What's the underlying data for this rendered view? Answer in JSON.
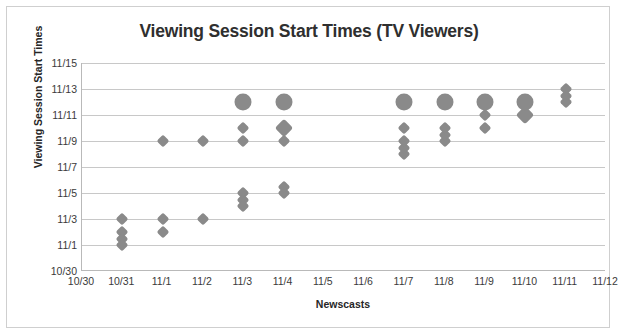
{
  "chart_data": {
    "type": "scatter",
    "title": "Viewing Session Start Times (TV Viewers)",
    "xlabel": "Newscasts",
    "ylabel": "Viewing Session Start Times",
    "grid": true,
    "legend": "none",
    "x_tick_labels": [
      "10/30",
      "10/31",
      "11/1",
      "11/2",
      "11/3",
      "11/4",
      "11/5",
      "11/6",
      "11/7",
      "11/8",
      "11/9",
      "11/10",
      "11/11",
      "11/12"
    ],
    "y_tick_labels": [
      "11/15",
      "11/13",
      "11/11",
      "11/9",
      "11/7",
      "11/5",
      "11/3",
      "11/1",
      "10/30"
    ],
    "xlim": [
      "10/30",
      "11/12"
    ],
    "ylim": [
      "10/30",
      "11/15"
    ],
    "x_values_numeric": [
      30,
      31,
      32,
      33,
      34,
      35,
      36,
      37,
      38,
      39,
      40,
      41,
      42,
      43
    ],
    "y_values_numeric": [
      46,
      44,
      42,
      40,
      38,
      36,
      34,
      32,
      30
    ],
    "points": [
      {
        "x": "10/31",
        "y": "11/3",
        "size": "small"
      },
      {
        "x": "10/31",
        "y": "11/2",
        "size": "small"
      },
      {
        "x": "10/31",
        "y": "11/1.5",
        "size": "small"
      },
      {
        "x": "10/31",
        "y": "11/1",
        "size": "small"
      },
      {
        "x": "11/1",
        "y": "11/3",
        "size": "small"
      },
      {
        "x": "11/1",
        "y": "11/2",
        "size": "small"
      },
      {
        "x": "11/1",
        "y": "11/9",
        "size": "small"
      },
      {
        "x": "11/2",
        "y": "11/3",
        "size": "small"
      },
      {
        "x": "11/2",
        "y": "11/9",
        "size": "small"
      },
      {
        "x": "11/3",
        "y": "11/5",
        "size": "small"
      },
      {
        "x": "11/3",
        "y": "11/4.5",
        "size": "small"
      },
      {
        "x": "11/3",
        "y": "11/4",
        "size": "small"
      },
      {
        "x": "11/3",
        "y": "11/9",
        "size": "small"
      },
      {
        "x": "11/3",
        "y": "11/10",
        "size": "small"
      },
      {
        "x": "11/3",
        "y": "11/12",
        "size": "large"
      },
      {
        "x": "11/4",
        "y": "11/5",
        "size": "small"
      },
      {
        "x": "11/4",
        "y": "11/5.5",
        "size": "small"
      },
      {
        "x": "11/4",
        "y": "11/9",
        "size": "small"
      },
      {
        "x": "11/4",
        "y": "11/10",
        "size": "medium"
      },
      {
        "x": "11/4",
        "y": "11/12",
        "size": "large"
      },
      {
        "x": "11/7",
        "y": "11/8",
        "size": "small"
      },
      {
        "x": "11/7",
        "y": "11/8.5",
        "size": "small"
      },
      {
        "x": "11/7",
        "y": "11/9",
        "size": "small"
      },
      {
        "x": "11/7",
        "y": "11/10",
        "size": "small"
      },
      {
        "x": "11/7",
        "y": "11/12",
        "size": "large"
      },
      {
        "x": "11/8",
        "y": "11/9",
        "size": "small"
      },
      {
        "x": "11/8",
        "y": "11/9.5",
        "size": "small"
      },
      {
        "x": "11/8",
        "y": "11/10",
        "size": "small"
      },
      {
        "x": "11/8",
        "y": "11/12",
        "size": "large"
      },
      {
        "x": "11/9",
        "y": "11/10",
        "size": "small"
      },
      {
        "x": "11/9",
        "y": "11/11",
        "size": "small"
      },
      {
        "x": "11/9",
        "y": "11/12",
        "size": "large"
      },
      {
        "x": "11/10",
        "y": "11/11",
        "size": "medium"
      },
      {
        "x": "11/10",
        "y": "11/12",
        "size": "large"
      },
      {
        "x": "11/11",
        "y": "11/12",
        "size": "small"
      },
      {
        "x": "11/11",
        "y": "11/12.5",
        "size": "small"
      },
      {
        "x": "11/11",
        "y": "11/13",
        "size": "small"
      }
    ],
    "marker_color": "#8a8a8a",
    "gridline_color": "#c8c8c8",
    "axis_color": "#b9b9b9"
  }
}
